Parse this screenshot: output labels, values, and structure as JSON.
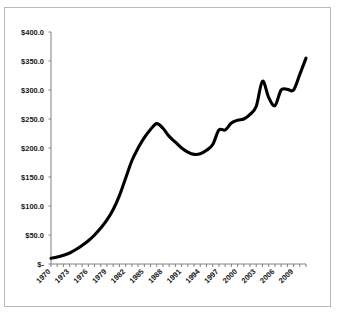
{
  "chart_data": {
    "type": "line",
    "title": "",
    "subtitle": "",
    "xlabel": "",
    "ylabel": "",
    "xlim": [
      1970,
      2011
    ],
    "ylim": [
      0,
      400
    ],
    "grid": false,
    "legend": null,
    "y_tick_labels": [
      "$400.0",
      "$350.0",
      "$300.0",
      "$250.0",
      "$200.0",
      "$150.0",
      "$100.0",
      "$50.0",
      "$-"
    ],
    "y_tick_values": [
      400,
      350,
      300,
      250,
      200,
      150,
      100,
      50,
      0
    ],
    "x_tick_labels": [
      "1970",
      "1973",
      "1976",
      "1979",
      "1982",
      "1985",
      "1988",
      "1991",
      "1994",
      "1997",
      "2000",
      "2003",
      "2006",
      "2009"
    ],
    "x_tick_values": [
      1970,
      1973,
      1976,
      1979,
      1982,
      1985,
      1988,
      1991,
      1994,
      1997,
      2000,
      2003,
      2006,
      2009
    ],
    "x_minor_tick_step": 1,
    "series": [
      {
        "name": "value",
        "x": [
          1970,
          1971,
          1972,
          1973,
          1974,
          1975,
          1976,
          1977,
          1978,
          1979,
          1980,
          1981,
          1982,
          1983,
          1984,
          1985,
          1986,
          1987,
          1988,
          1989,
          1990,
          1991,
          1992,
          1993,
          1994,
          1995,
          1996,
          1997,
          1998,
          1999,
          2000,
          2001,
          2002,
          2003,
          2004,
          2005,
          2006,
          2007,
          2008,
          2009,
          2010,
          2011
        ],
        "values": [
          10,
          12,
          15,
          19,
          25,
          32,
          40,
          50,
          62,
          76,
          94,
          118,
          148,
          178,
          200,
          218,
          232,
          242,
          234,
          220,
          210,
          200,
          193,
          189,
          190,
          196,
          206,
          231,
          231,
          243,
          248,
          250,
          258,
          272,
          315,
          287,
          273,
          300,
          301,
          300,
          327,
          355
        ]
      }
    ]
  },
  "axis": {
    "y_axis_name": "y-axis",
    "x_axis_name": "x-axis"
  },
  "colors": {
    "line": "#000000",
    "axis": "#808080",
    "border": "#b8b8b8",
    "background": "#ffffff",
    "text": "#1a1a1a"
  }
}
